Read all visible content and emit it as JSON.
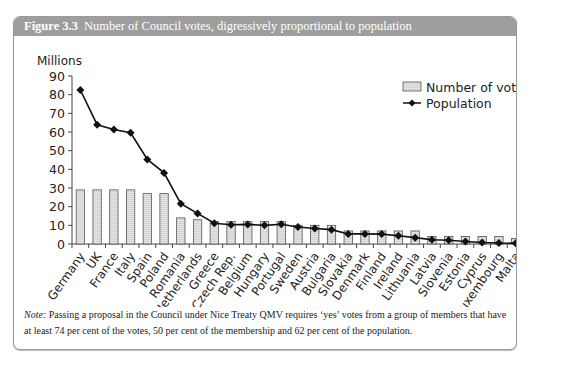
{
  "figure": {
    "label": "Figure 3.3",
    "title": "Number of Council votes, digressively proportional to population"
  },
  "note": {
    "label": "Note:",
    "text": "Passing a proposal in the Council under Nice Treaty QMV requires ‘yes’ votes from a group of members that have at least 74 per cent of the votes, 50 per cent of the membership and 62 per cent of the population."
  },
  "colors": {
    "header_bg": "#9e9e9e",
    "bar_fill": "#e4e4e4",
    "bar_stroke": "#555555",
    "line": "#111111"
  },
  "chart_data": {
    "type": "bar",
    "title": "Number of Council votes, digressively proportional to population",
    "ylabel": "Millions",
    "xlabel": "",
    "ylim": [
      0,
      90
    ],
    "yticks": [
      0,
      10,
      20,
      30,
      40,
      50,
      60,
      70,
      80,
      90
    ],
    "grid": false,
    "legend_position": "upper right",
    "categories": [
      "Germany",
      "UK",
      "France",
      "Italy",
      "Spain",
      "Poland",
      "Romania",
      "Netherlands",
      "Greece",
      "Czech Rep.",
      "Belgium",
      "Hungary",
      "Portugal",
      "Sweden",
      "Austria",
      "Bulgaria",
      "Slovakia",
      "Denmark",
      "Finland",
      "Ireland",
      "Lithuania",
      "Latvia",
      "Slovenia",
      "Estonia",
      "Cyprus",
      "Luxembourg",
      "Malta"
    ],
    "series": [
      {
        "name": "Number of votes",
        "type": "bar",
        "values": [
          29,
          29,
          29,
          29,
          27,
          27,
          14,
          13,
          12,
          12,
          12,
          12,
          12,
          10,
          10,
          10,
          7,
          7,
          7,
          7,
          7,
          4,
          4,
          4,
          4,
          4,
          3
        ]
      },
      {
        "name": "Population",
        "type": "line",
        "values": [
          82.5,
          63.9,
          61.3,
          59.6,
          45.3,
          38.1,
          21.6,
          16.4,
          11.1,
          10.3,
          10.5,
          10.0,
          10.6,
          9.1,
          8.3,
          7.7,
          5.4,
          5.4,
          5.3,
          4.4,
          3.4,
          2.3,
          2.0,
          1.3,
          0.8,
          0.5,
          0.4
        ]
      }
    ]
  }
}
